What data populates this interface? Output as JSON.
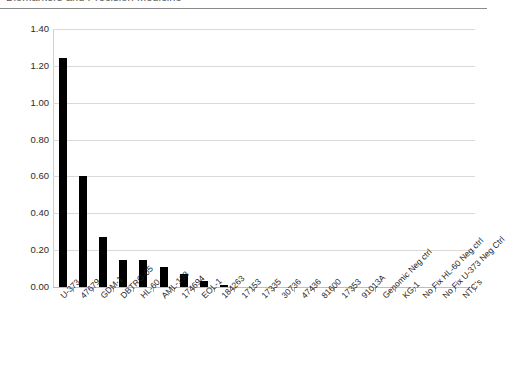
{
  "page_header": {
    "text": "Biomarkers and Precision Medicine"
  },
  "chart_data": {
    "type": "bar",
    "title": "",
    "subtitle": "",
    "xlabel": "",
    "ylabel": "",
    "ylim": [
      0.0,
      1.4
    ],
    "ytick_labels": [
      "1.40",
      "1.20",
      "1.00",
      "0.80",
      "0.60",
      "0.40",
      "0.20",
      "0.00"
    ],
    "ytick_values": [
      1.4,
      1.2,
      1.0,
      0.8,
      0.6,
      0.4,
      0.2,
      0.0
    ],
    "grid": true,
    "legend": "none",
    "bar_color": "#000000",
    "gridline_color": "#d9d9d9",
    "categories": [
      "U-373",
      "47679",
      "GDM-1",
      "DBTRG-05",
      "HL-60",
      "AML-193",
      "174694",
      "EOL-1",
      "184263",
      "17153",
      "17335",
      "30736",
      "47436",
      "81600",
      "17353",
      "91013A",
      "Genomic Neg ctrl",
      "KG-1",
      "No Fix HL-60 Neg ctrl",
      "No Fix U-373 Neg Ctrl",
      "NTC's"
    ],
    "values": [
      1.24,
      0.6,
      0.27,
      0.145,
      0.145,
      0.11,
      0.07,
      0.03,
      0.012,
      0.0,
      0.0,
      0.0,
      0.0,
      0.0,
      0.0,
      0.0,
      0.0,
      0.0,
      0.0,
      0.0,
      0.0
    ]
  }
}
